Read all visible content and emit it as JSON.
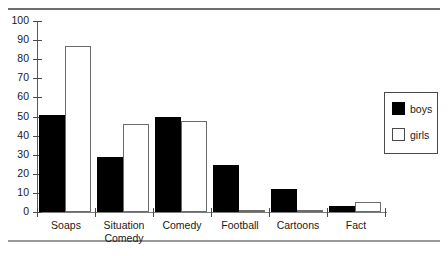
{
  "chart_data": {
    "type": "bar",
    "title": "",
    "xlabel": "",
    "ylabel": "",
    "ylim": [
      0,
      100
    ],
    "ytick_step": 10,
    "grid": false,
    "legend_position": "right",
    "categories": [
      "Soaps",
      "Situation\nComedy",
      "Comedy",
      "Football",
      "Cartoons",
      "Fact"
    ],
    "ytick_labels": [
      "100",
      "90",
      "80",
      "70",
      "60",
      "50",
      "40",
      "30",
      "20",
      "10",
      "0"
    ],
    "series": [
      {
        "name": "boys",
        "color": "#000000",
        "values": [
          51,
          29,
          50,
          24.5,
          12,
          3
        ]
      },
      {
        "name": "girls",
        "color": "#ffffff",
        "values": [
          87,
          46,
          47.5,
          1,
          1,
          5
        ]
      }
    ]
  },
  "legend": {
    "items": [
      {
        "label": "boys",
        "style": "filled"
      },
      {
        "label": "girls",
        "style": "outline"
      }
    ]
  }
}
